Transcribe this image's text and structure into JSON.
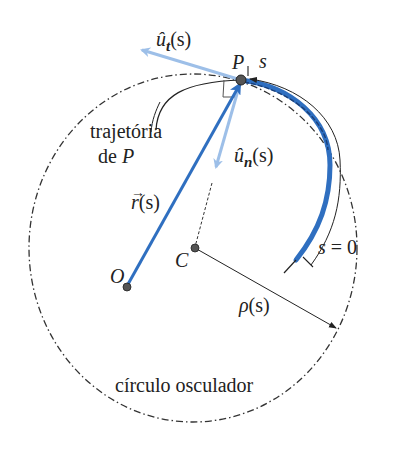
{
  "labels": {
    "unit_tangent": {
      "base": "û",
      "sub": "t",
      "arg": "(s)"
    },
    "unit_normal": {
      "base": "û",
      "sub": "n",
      "arg": "(s)"
    },
    "point_P": "P",
    "arc_s": "s",
    "trajectory_line1": "trajetória",
    "trajectory_line2_prefix": "de ",
    "trajectory_line2_var": "P",
    "position_vector": {
      "base": "r",
      "arrow": "→",
      "arg": "(s)"
    },
    "origin": "O",
    "center": "C",
    "s_zero": {
      "var": "s",
      "eq": "= 0"
    },
    "radius": {
      "base": "ρ",
      "arg": "(s)"
    },
    "osculating_circle": "círculo osculador"
  },
  "colors": {
    "blue_dark": "#2f6fc0",
    "blue_light": "#9dbfe8",
    "ink": "#222222",
    "point_fill": "#555555"
  }
}
